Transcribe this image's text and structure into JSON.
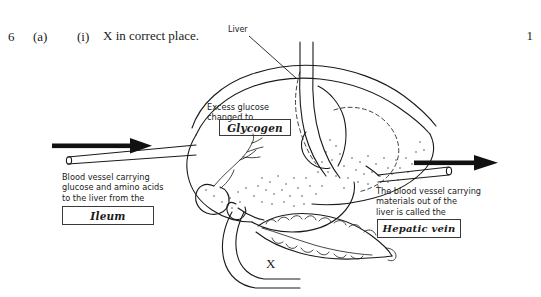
{
  "question": {
    "number": "6",
    "part": "(a)",
    "subpart": "(i)",
    "text": "X in correct place.",
    "marks": "1"
  },
  "diagram": {
    "labels": {
      "liver": "Liver",
      "x_mark": "X"
    },
    "annotations": [
      {
        "name": "excess-glucose-note",
        "text": "Excess glucose\nchanged to",
        "answer": "Glycogen"
      },
      {
        "name": "incoming-vessel-note",
        "text": "Blood vessel carrying\nglucose and amino acids\nto the liver from the",
        "answer": "Ileum"
      },
      {
        "name": "outgoing-vessel-note",
        "text": "The blood vessel carrying\nmaterials out of the\nliver is called the",
        "answer": "Hepatic vein"
      }
    ],
    "arrows": [
      {
        "name": "inflow-arrow",
        "direction": "right"
      },
      {
        "name": "outflow-arrow",
        "direction": "right"
      }
    ]
  },
  "colors": {
    "ink": "#1a1a1a",
    "paper": "#ffffff",
    "box_border": "#3a3a3a"
  }
}
